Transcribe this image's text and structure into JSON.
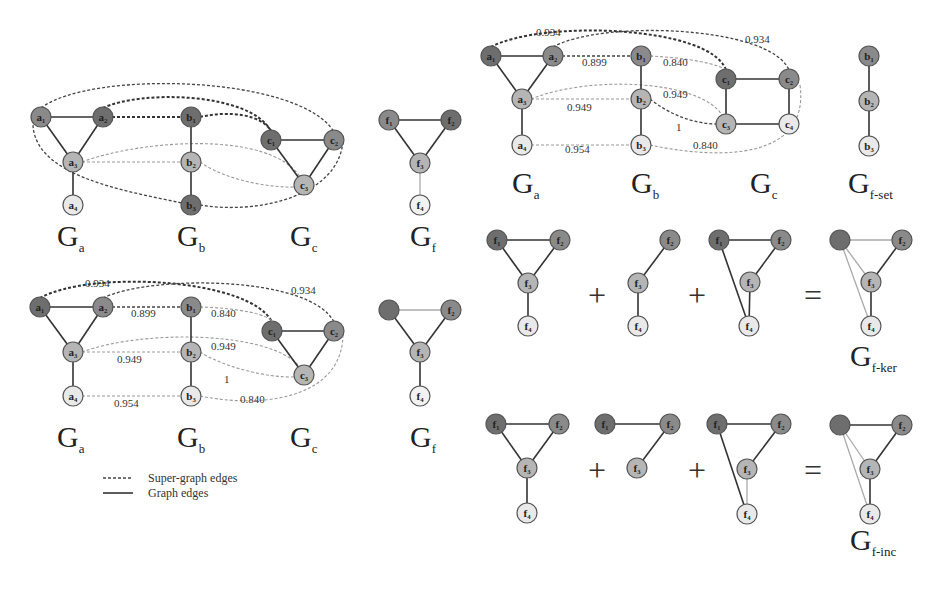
{
  "colors": {
    "dark": "#6e6e6e",
    "mid": "#8a8a8a",
    "light": "#b5b5b5",
    "pale": "#e9e9e9",
    "faded": "#f2f2f2"
  },
  "legend": {
    "super_graph_edges": "Super-graph edges",
    "graph_edges": "Graph edges"
  },
  "panels": [
    {
      "id": "top-left",
      "labels": [
        {
          "main": "G",
          "sub": "a",
          "x": 57,
          "y": 246
        },
        {
          "main": "G",
          "sub": "b",
          "x": 177,
          "y": 246
        },
        {
          "main": "G",
          "sub": "c",
          "x": 290,
          "y": 246
        },
        {
          "main": "G",
          "sub": "f",
          "x": 410,
          "y": 246
        }
      ],
      "nodes": [
        {
          "id": "a1",
          "label": "a₁",
          "x": 41,
          "y": 117,
          "fill": "mid"
        },
        {
          "id": "a2",
          "label": "a₂",
          "x": 103,
          "y": 117,
          "fill": "dark"
        },
        {
          "id": "a3",
          "label": "a₃",
          "x": 73,
          "y": 162,
          "fill": "light"
        },
        {
          "id": "a4",
          "label": "a₄",
          "x": 73,
          "y": 205,
          "fill": "pale"
        },
        {
          "id": "b2t",
          "label": "b₁",
          "x": 191,
          "y": 117,
          "fill": "dark"
        },
        {
          "id": "b3t",
          "label": "b₂",
          "x": 191,
          "y": 162,
          "fill": "light"
        },
        {
          "id": "b1t",
          "label": "b₃",
          "x": 191,
          "y": 205,
          "fill": "dark"
        },
        {
          "id": "c1",
          "label": "c₁",
          "x": 271,
          "y": 140,
          "fill": "dark"
        },
        {
          "id": "c2",
          "label": "c₂",
          "x": 334,
          "y": 140,
          "fill": "mid"
        },
        {
          "id": "c3",
          "label": "c₃",
          "x": 304,
          "y": 185,
          "fill": "light"
        },
        {
          "id": "f1",
          "label": "f₁",
          "x": 389,
          "y": 120,
          "fill": "mid"
        },
        {
          "id": "f2",
          "label": "f₂",
          "x": 451,
          "y": 120,
          "fill": "dark"
        },
        {
          "id": "f3",
          "label": "f₃",
          "x": 420,
          "y": 163,
          "fill": "light"
        },
        {
          "id": "f4",
          "label": "f₄",
          "x": 420,
          "y": 205,
          "fill": "faded"
        }
      ],
      "graph_edges": [
        [
          "a1",
          "a2"
        ],
        [
          "a1",
          "a3"
        ],
        [
          "a2",
          "a3"
        ],
        [
          "a3",
          "a4"
        ],
        [
          "b2t",
          "b3t"
        ],
        [
          "b3t",
          "b1t"
        ],
        [
          "c1",
          "c2"
        ],
        [
          "c1",
          "c3"
        ],
        [
          "c2",
          "c3"
        ],
        [
          "f1",
          "f2"
        ],
        [
          "f1",
          "f3"
        ],
        [
          "f2",
          "f3"
        ]
      ],
      "faint_edges": [
        [
          "f3",
          "f4"
        ]
      ]
    },
    {
      "id": "bottom-left",
      "labels": [
        {
          "main": "G",
          "sub": "a",
          "x": 57,
          "y": 447
        },
        {
          "main": "G",
          "sub": "b",
          "x": 177,
          "y": 447
        },
        {
          "main": "G",
          "sub": "c",
          "x": 290,
          "y": 447
        },
        {
          "main": "G",
          "sub": "f",
          "x": 410,
          "y": 447
        }
      ],
      "nodes": [
        {
          "id": "a1",
          "label": "a₁",
          "x": 40,
          "y": 307,
          "fill": "dark"
        },
        {
          "id": "a2",
          "label": "a₂",
          "x": 103,
          "y": 307,
          "fill": "mid"
        },
        {
          "id": "a3",
          "label": "a₃",
          "x": 73,
          "y": 352,
          "fill": "light"
        },
        {
          "id": "a4",
          "label": "a₄",
          "x": 73,
          "y": 396,
          "fill": "pale"
        },
        {
          "id": "b1",
          "label": "b₁",
          "x": 191,
          "y": 307,
          "fill": "mid"
        },
        {
          "id": "b2",
          "label": "b₂",
          "x": 191,
          "y": 352,
          "fill": "light"
        },
        {
          "id": "b3",
          "label": "b₃",
          "x": 191,
          "y": 396,
          "fill": "pale"
        },
        {
          "id": "c1",
          "label": "c₁",
          "x": 272,
          "y": 331,
          "fill": "dark"
        },
        {
          "id": "c2",
          "label": "c₂",
          "x": 334,
          "y": 331,
          "fill": "mid"
        },
        {
          "id": "c3",
          "label": "c₃",
          "x": 304,
          "y": 375,
          "fill": "light"
        },
        {
          "id": "f1",
          "label": "",
          "x": 389,
          "y": 310,
          "fill": "dark"
        },
        {
          "id": "f2",
          "label": "f₂",
          "x": 451,
          "y": 310,
          "fill": "mid"
        },
        {
          "id": "f3",
          "label": "f₃",
          "x": 420,
          "y": 352,
          "fill": "light"
        },
        {
          "id": "f4",
          "label": "f₄",
          "x": 420,
          "y": 396,
          "fill": "faded"
        }
      ],
      "graph_edges": [
        [
          "a1",
          "a2"
        ],
        [
          "a1",
          "a3"
        ],
        [
          "a2",
          "a3"
        ],
        [
          "a3",
          "a4"
        ],
        [
          "b1",
          "b2"
        ],
        [
          "b2",
          "b3"
        ],
        [
          "c1",
          "c2"
        ],
        [
          "c1",
          "c3"
        ],
        [
          "c2",
          "c3"
        ],
        [
          "f1",
          "f3"
        ],
        [
          "f2",
          "f3"
        ],
        [
          "f3",
          "f4"
        ]
      ],
      "faint_edges": [
        [
          "f1",
          "f2"
        ]
      ],
      "weights": [
        {
          "text": "0.934",
          "x": 85,
          "y": 287
        },
        {
          "text": "0.899",
          "x": 131,
          "y": 317
        },
        {
          "text": "0.840",
          "x": 211,
          "y": 317
        },
        {
          "text": "0.934",
          "x": 291,
          "y": 294
        },
        {
          "text": "0.949",
          "x": 211,
          "y": 350
        },
        {
          "text": "0.949",
          "x": 117,
          "y": 363
        },
        {
          "text": "1",
          "x": 224,
          "y": 383
        },
        {
          "text": "0.954",
          "x": 114,
          "y": 407
        },
        {
          "text": "0.840",
          "x": 240,
          "y": 403
        }
      ]
    },
    {
      "id": "top-right",
      "labels": [
        {
          "main": "G",
          "sub": "a",
          "x": 512,
          "y": 193
        },
        {
          "main": "G",
          "sub": "b",
          "x": 631,
          "y": 193
        },
        {
          "main": "G",
          "sub": "c",
          "x": 750,
          "y": 193
        },
        {
          "main": "G",
          "sub": "f-set",
          "x": 848,
          "y": 193
        }
      ],
      "nodes": [
        {
          "id": "a1",
          "label": "a₁",
          "x": 491,
          "y": 56,
          "fill": "dark"
        },
        {
          "id": "a2",
          "label": "a₂",
          "x": 553,
          "y": 56,
          "fill": "mid"
        },
        {
          "id": "a3",
          "label": "a₃",
          "x": 522,
          "y": 99,
          "fill": "light"
        },
        {
          "id": "a4",
          "label": "a₄",
          "x": 522,
          "y": 145,
          "fill": "pale"
        },
        {
          "id": "b1",
          "label": "b₁",
          "x": 641,
          "y": 56,
          "fill": "mid"
        },
        {
          "id": "b2",
          "label": "b₂",
          "x": 641,
          "y": 99,
          "fill": "light"
        },
        {
          "id": "b3",
          "label": "b₃",
          "x": 641,
          "y": 145,
          "fill": "pale"
        },
        {
          "id": "c1",
          "label": "c₁",
          "x": 726,
          "y": 79,
          "fill": "dark"
        },
        {
          "id": "c2",
          "label": "c₂",
          "x": 789,
          "y": 79,
          "fill": "mid"
        },
        {
          "id": "c3",
          "label": "c₃",
          "x": 726,
          "y": 124,
          "fill": "light"
        },
        {
          "id": "c4",
          "label": "c₄",
          "x": 789,
          "y": 124,
          "fill": "pale"
        },
        {
          "id": "fb1",
          "label": "b₁",
          "x": 869,
          "y": 56,
          "fill": "mid"
        },
        {
          "id": "fb2",
          "label": "b₂",
          "x": 869,
          "y": 101,
          "fill": "light"
        },
        {
          "id": "fb3",
          "label": "b₃",
          "x": 869,
          "y": 146,
          "fill": "pale"
        }
      ],
      "graph_edges": [
        [
          "a1",
          "a2"
        ],
        [
          "a1",
          "a3"
        ],
        [
          "a2",
          "a3"
        ],
        [
          "a3",
          "a4"
        ],
        [
          "b1",
          "b2"
        ],
        [
          "b2",
          "b3"
        ],
        [
          "c1",
          "c2"
        ],
        [
          "c1",
          "c3"
        ],
        [
          "c2",
          "c4"
        ],
        [
          "c3",
          "c4"
        ],
        [
          "fb1",
          "fb2"
        ],
        [
          "fb2",
          "fb3"
        ]
      ],
      "faint_edges": [],
      "weights": [
        {
          "text": "0.934",
          "x": 536,
          "y": 36
        },
        {
          "text": "0.899",
          "x": 582,
          "y": 66
        },
        {
          "text": "0.840",
          "x": 663,
          "y": 66
        },
        {
          "text": "0.934",
          "x": 745,
          "y": 43
        },
        {
          "text": "0.949",
          "x": 663,
          "y": 98
        },
        {
          "text": "0.949",
          "x": 567,
          "y": 111
        },
        {
          "text": "1",
          "x": 676,
          "y": 131
        },
        {
          "text": "0.954",
          "x": 565,
          "y": 153
        },
        {
          "text": "0.840",
          "x": 693,
          "y": 149
        }
      ]
    },
    {
      "id": "ker-row",
      "labels": [
        {
          "main": "G",
          "sub": "f-ker",
          "x": 850,
          "y": 366
        }
      ],
      "operators": [
        {
          "text": "+",
          "x": 597,
          "y": 295
        },
        {
          "text": "+",
          "x": 697,
          "y": 295
        },
        {
          "text": "=",
          "x": 813,
          "y": 295
        }
      ],
      "nodes": [
        {
          "id": "k1f1",
          "label": "f₁",
          "x": 497,
          "y": 240,
          "fill": "dark"
        },
        {
          "id": "k1f2",
          "label": "f₂",
          "x": 560,
          "y": 240,
          "fill": "mid"
        },
        {
          "id": "k1f3",
          "label": "f₃",
          "x": 528,
          "y": 283,
          "fill": "light"
        },
        {
          "id": "k1f4",
          "label": "f₄",
          "x": 528,
          "y": 326,
          "fill": "pale"
        },
        {
          "id": "k2f2",
          "label": "f₂",
          "x": 670,
          "y": 240,
          "fill": "mid"
        },
        {
          "id": "k2f3",
          "label": "f₃",
          "x": 638,
          "y": 283,
          "fill": "light"
        },
        {
          "id": "k2f4",
          "label": "f₄",
          "x": 638,
          "y": 326,
          "fill": "pale"
        },
        {
          "id": "k3f1",
          "label": "f₁",
          "x": 719,
          "y": 240,
          "fill": "dark"
        },
        {
          "id": "k3f2",
          "label": "f₂",
          "x": 781,
          "y": 240,
          "fill": "mid"
        },
        {
          "id": "k3f3",
          "label": "f₃",
          "x": 750,
          "y": 282,
          "fill": "light"
        },
        {
          "id": "k3f4",
          "label": "f₄",
          "x": 749,
          "y": 326,
          "fill": "pale"
        },
        {
          "id": "krf1",
          "label": "",
          "x": 840,
          "y": 240,
          "fill": "dark"
        },
        {
          "id": "krf2",
          "label": "f₂",
          "x": 902,
          "y": 240,
          "fill": "mid"
        },
        {
          "id": "krf3",
          "label": "f₃",
          "x": 871,
          "y": 282,
          "fill": "light"
        },
        {
          "id": "krf4",
          "label": "f₄",
          "x": 871,
          "y": 326,
          "fill": "pale"
        }
      ],
      "graph_edges": [
        [
          "k1f1",
          "k1f2"
        ],
        [
          "k1f1",
          "k1f3"
        ],
        [
          "k1f2",
          "k1f3"
        ],
        [
          "k1f3",
          "k1f4"
        ],
        [
          "k2f2",
          "k2f3"
        ],
        [
          "k2f3",
          "k2f4"
        ],
        [
          "k3f1",
          "k3f2"
        ],
        [
          "k3f2",
          "k3f3"
        ],
        [
          "k3f3",
          "k3f4"
        ],
        [
          "k3f1",
          "k3f4"
        ],
        [
          "krf2",
          "krf3"
        ],
        [
          "krf3",
          "krf4"
        ]
      ],
      "faint_edges": [
        [
          "krf1",
          "krf2"
        ],
        [
          "krf1",
          "krf3"
        ],
        [
          "krf1",
          "krf4"
        ]
      ]
    },
    {
      "id": "inc-row",
      "labels": [
        {
          "main": "G",
          "sub": "f-inc",
          "x": 850,
          "y": 550
        }
      ],
      "operators": [
        {
          "text": "+",
          "x": 597,
          "y": 470
        },
        {
          "text": "+",
          "x": 697,
          "y": 470
        },
        {
          "text": "=",
          "x": 813,
          "y": 470
        }
      ],
      "nodes": [
        {
          "id": "i1f1",
          "label": "f₁",
          "x": 496,
          "y": 424,
          "fill": "dark"
        },
        {
          "id": "i1f2",
          "label": "f₂",
          "x": 559,
          "y": 424,
          "fill": "mid"
        },
        {
          "id": "i1f3",
          "label": "f₃",
          "x": 527,
          "y": 468,
          "fill": "light"
        },
        {
          "id": "i1f4",
          "label": "f₄",
          "x": 527,
          "y": 513,
          "fill": "pale"
        },
        {
          "id": "i2f1",
          "label": "f₁",
          "x": 605,
          "y": 424,
          "fill": "dark"
        },
        {
          "id": "i2f2",
          "label": "f₂",
          "x": 670,
          "y": 424,
          "fill": "mid"
        },
        {
          "id": "i2f3",
          "label": "f₃",
          "x": 637,
          "y": 468,
          "fill": "light"
        },
        {
          "id": "i3f1",
          "label": "f₁",
          "x": 717,
          "y": 424,
          "fill": "dark"
        },
        {
          "id": "i3f2",
          "label": "f₂",
          "x": 781,
          "y": 424,
          "fill": "mid"
        },
        {
          "id": "i3f3",
          "label": "f₃",
          "x": 747,
          "y": 469,
          "fill": "light"
        },
        {
          "id": "i3f4",
          "label": "f₄",
          "x": 747,
          "y": 514,
          "fill": "pale"
        },
        {
          "id": "irf1",
          "label": "",
          "x": 840,
          "y": 425,
          "fill": "dark"
        },
        {
          "id": "irf2",
          "label": "f₂",
          "x": 902,
          "y": 425,
          "fill": "mid"
        },
        {
          "id": "irf3",
          "label": "f₃",
          "x": 870,
          "y": 469,
          "fill": "light"
        },
        {
          "id": "irf4",
          "label": "f₄",
          "x": 870,
          "y": 514,
          "fill": "pale"
        }
      ],
      "graph_edges": [
        [
          "i1f1",
          "i1f2"
        ],
        [
          "i1f1",
          "i1f3"
        ],
        [
          "i1f2",
          "i1f3"
        ],
        [
          "i1f3",
          "i1f4"
        ],
        [
          "i2f1",
          "i2f2"
        ],
        [
          "i2f2",
          "i2f3"
        ],
        [
          "i3f1",
          "i3f2"
        ],
        [
          "i3f2",
          "i3f3"
        ],
        [
          "i3f1",
          "i3f4"
        ],
        [
          "irf1",
          "irf2"
        ],
        [
          "irf2",
          "irf3"
        ],
        [
          "irf3",
          "irf4"
        ]
      ],
      "faint_edges": [
        [
          "i3f3",
          "i3f4"
        ],
        [
          "irf1",
          "irf3"
        ],
        [
          "irf1",
          "irf4"
        ]
      ]
    }
  ]
}
